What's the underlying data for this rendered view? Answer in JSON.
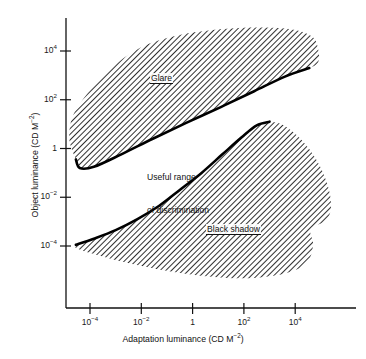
{
  "chart_data": {
    "type": "area",
    "title": "",
    "xlabel": "Adaptation luminance (CD M⁻²)",
    "ylabel": "Object luminance (CD M⁻²)",
    "xlabel_parts": {
      "text": "Adaptation luminance (CD M",
      "exp": "−2",
      "tail": ")"
    },
    "ylabel_parts": {
      "text": "Object luminance (CD M",
      "exp": "−2",
      "tail": ")"
    },
    "x_scale": "log10",
    "y_scale": "log10",
    "xlim": [
      -5.5,
      6.2
    ],
    "ylim": [
      -5.4,
      5.4
    ],
    "grid": false,
    "legend": "none",
    "x_ticks": [
      {
        "value": -4,
        "label": "10",
        "exp": "−4"
      },
      {
        "value": -2,
        "label": "10",
        "exp": "−2"
      },
      {
        "value": 0,
        "label": "1",
        "exp": ""
      },
      {
        "value": 2,
        "label": "10",
        "exp": "2"
      },
      {
        "value": 4,
        "label": "10",
        "exp": "4"
      }
    ],
    "y_ticks": [
      {
        "value": 4,
        "label": "10",
        "exp": "4"
      },
      {
        "value": 2,
        "label": "10",
        "exp": "2"
      },
      {
        "value": 0,
        "label": "1",
        "exp": ""
      },
      {
        "value": -2,
        "label": "10",
        "exp": "−2"
      },
      {
        "value": -4,
        "label": "10",
        "exp": "−4"
      }
    ],
    "regions": [
      {
        "name": "glare",
        "label": "Glare",
        "fill": "hatch-45",
        "edge_style": "thick-dark-lower-boundary",
        "description": "Upper band: object luminance far above adaptation luminance produces glare.",
        "boundary_log": [
          [
            -4.55,
            -0.45
          ],
          [
            -4.8,
            0.35
          ],
          [
            -4.7,
            1.25
          ],
          [
            -4.25,
            2.05
          ],
          [
            -3.55,
            2.9
          ],
          [
            -2.7,
            3.7
          ],
          [
            -1.7,
            4.3
          ],
          [
            -0.55,
            4.65
          ],
          [
            0.7,
            4.85
          ],
          [
            1.95,
            4.95
          ],
          [
            3.1,
            4.95
          ],
          [
            4.05,
            4.85
          ],
          [
            4.7,
            4.55
          ],
          [
            4.9,
            4.05
          ],
          [
            4.9,
            3.55
          ],
          [
            4.55,
            3.3
          ],
          [
            3.6,
            2.95
          ],
          [
            2.4,
            2.35
          ],
          [
            1.1,
            1.7
          ],
          [
            -0.25,
            1.05
          ],
          [
            -1.55,
            0.4
          ],
          [
            -2.8,
            -0.25
          ],
          [
            -3.85,
            -0.75
          ],
          [
            -4.4,
            -0.8
          ]
        ]
      },
      {
        "name": "black-shadow",
        "label": "Black shadow",
        "fill": "hatch-45",
        "edge_style": "thick-dark-upper-boundary",
        "description": "Lower blob: object luminance far below adaptation luminance appears as black shadow.",
        "boundary_log": [
          [
            -4.55,
            -3.95
          ],
          [
            -3.85,
            -3.7
          ],
          [
            -3.0,
            -3.35
          ],
          [
            -2.15,
            -2.9
          ],
          [
            -1.3,
            -2.35
          ],
          [
            -0.5,
            -1.7
          ],
          [
            0.35,
            -1.0
          ],
          [
            1.15,
            -0.25
          ],
          [
            1.9,
            0.45
          ],
          [
            2.5,
            0.95
          ],
          [
            3.0,
            1.1
          ],
          [
            3.55,
            0.95
          ],
          [
            4.25,
            0.35
          ],
          [
            4.85,
            -0.5
          ],
          [
            5.25,
            -1.45
          ],
          [
            5.4,
            -2.35
          ],
          [
            5.2,
            -2.95
          ],
          [
            4.6,
            -3.3
          ],
          [
            4.7,
            -3.95
          ],
          [
            4.45,
            -4.7
          ],
          [
            3.7,
            -5.1
          ],
          [
            2.55,
            -5.3
          ],
          [
            1.2,
            -5.3
          ],
          [
            -0.2,
            -5.15
          ],
          [
            -1.6,
            -4.9
          ],
          [
            -2.9,
            -4.6
          ],
          [
            -3.95,
            -4.3
          ],
          [
            -4.5,
            -4.1
          ]
        ]
      },
      {
        "name": "useful-range",
        "label": "Useful range\nof discrimination",
        "fill": "none",
        "edge_style": "none",
        "description": "Unshaded region between the glare band and the black-shadow blob."
      }
    ],
    "annotations": [
      {
        "name": "glare-label",
        "text": "Glare",
        "underline": true
      },
      {
        "name": "useful-range-label",
        "text": "Useful range\nof discrimination",
        "underline": false
      },
      {
        "name": "black-shadow-label",
        "text": "Black shadow",
        "underline": true
      }
    ],
    "colors": {
      "background": "#ffffff",
      "axis": "#111111",
      "hatch": "#2b2b2b",
      "edge": "#000000",
      "text": "#111111"
    }
  },
  "labels": {
    "glare": "Glare",
    "useful_range_line1": "Useful range",
    "useful_range_line2": "of discrimination",
    "black_shadow": "Black shadow"
  },
  "axis_titles": {
    "x_main": "Adaptation luminance (CD M",
    "x_exp": "−2",
    "x_tail": ")",
    "y_main": "Object luminance (CD M",
    "y_exp": "−2",
    "y_tail": ")"
  },
  "ticks": {
    "x": [
      {
        "base": "10",
        "exp": "−4"
      },
      {
        "base": "10",
        "exp": "−2"
      },
      {
        "base": "1",
        "exp": ""
      },
      {
        "base": "10",
        "exp": "2"
      },
      {
        "base": "10",
        "exp": "4"
      }
    ],
    "y": [
      {
        "base": "10",
        "exp": "4"
      },
      {
        "base": "10",
        "exp": "2"
      },
      {
        "base": "1",
        "exp": ""
      },
      {
        "base": "10",
        "exp": "−2"
      },
      {
        "base": "10",
        "exp": "−4"
      }
    ]
  }
}
